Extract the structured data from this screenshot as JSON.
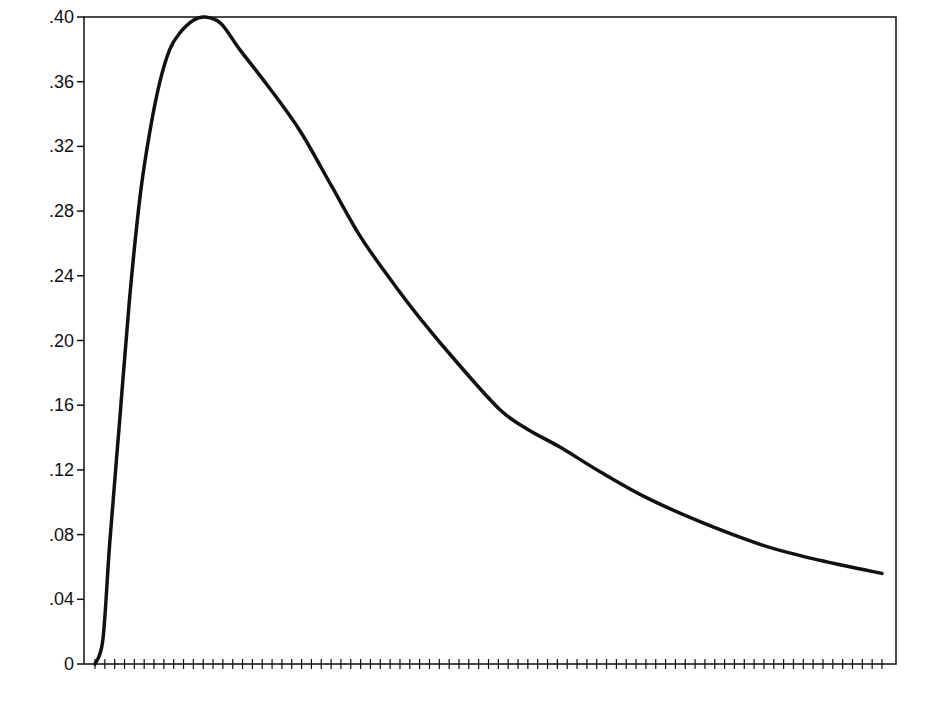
{
  "chart_data": {
    "type": "line",
    "title": "",
    "xlabel": "",
    "ylabel": "",
    "ylim": [
      0,
      0.4
    ],
    "xlim": [
      0,
      80
    ],
    "grid": false,
    "legend": null,
    "y_tick_labels": [
      "0",
      ".04",
      ".08",
      ".12",
      ".16",
      ".20",
      ".24",
      ".28",
      ".32",
      ".36",
      ".40"
    ],
    "y_tick_values": [
      0,
      0.04,
      0.08,
      0.12,
      0.16,
      0.2,
      0.24,
      0.28,
      0.32,
      0.36,
      0.4
    ],
    "x_tick_count": 81,
    "x_tick_labels": [],
    "series": [
      {
        "name": "density",
        "color": "#111111",
        "x": [
          0,
          0.8,
          1.5,
          2.5,
          3.5,
          4.6,
          5.6,
          6.6,
          7.6,
          8.6,
          10.0,
          11.2,
          12.8,
          14.7,
          17.5,
          20.8,
          24.0,
          26.9,
          30.0,
          33.0,
          37.0,
          41.2,
          44.0,
          47.3,
          51.3,
          56.0,
          61.5,
          67.6,
          71.7,
          76.0,
          80.0
        ],
        "values": [
          0,
          0.015,
          0.075,
          0.15,
          0.225,
          0.29,
          0.33,
          0.36,
          0.38,
          0.39,
          0.398,
          0.4,
          0.396,
          0.38,
          0.358,
          0.33,
          0.296,
          0.265,
          0.238,
          0.214,
          0.185,
          0.157,
          0.145,
          0.134,
          0.119,
          0.103,
          0.088,
          0.074,
          0.067,
          0.061,
          0.056
        ]
      }
    ]
  },
  "colors": {
    "line": "#111111",
    "frame": "#111111",
    "background": "#ffffff"
  }
}
